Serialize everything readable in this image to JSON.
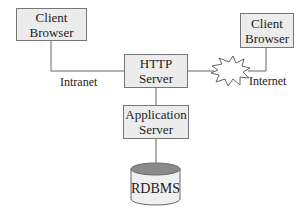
{
  "diagram": {
    "nodes": {
      "client_left": {
        "line1": "Client",
        "line2": "Browser"
      },
      "client_right": {
        "line1": "Client",
        "line2": "Browser"
      },
      "http_server": {
        "line1": "HTTP",
        "line2": "Server"
      },
      "app_server": {
        "line1": "Application",
        "line2": "Server"
      },
      "database": {
        "label": "RDBMS"
      }
    },
    "edge_labels": {
      "intranet": "Intranet",
      "internet": "Internet"
    },
    "edges": [
      {
        "from": "client_left",
        "to": "http_server",
        "label": "Intranet"
      },
      {
        "from": "http_server",
        "to": "client_right",
        "label": "Internet",
        "via": "internet-cloud"
      },
      {
        "from": "http_server",
        "to": "app_server"
      },
      {
        "from": "app_server",
        "to": "database"
      }
    ],
    "colors": {
      "box_fill": "#ececec",
      "box_border": "#777777",
      "line": "#666666",
      "db_top": "#8a8a8a"
    }
  }
}
